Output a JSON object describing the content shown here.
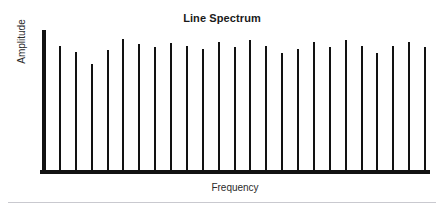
{
  "figure": {
    "background_color": "#ffffff",
    "ink_color": "#121212",
    "divider_color": "#c9c9cf"
  },
  "title": "Line Spectrum",
  "axes": {
    "ylabel": "Amplitude",
    "xlabel": "Frequency"
  },
  "chart_data": {
    "type": "bar",
    "title": "Line Spectrum",
    "subtitle": "",
    "xlabel": "Frequency",
    "ylabel": "Amplitude",
    "grid": false,
    "legend": false,
    "legend_position": "none",
    "xlim": [
      0,
      25
    ],
    "ylim": [
      0,
      1
    ],
    "xticks": [],
    "yticks": [],
    "xticklabels": [],
    "yticklabels": [],
    "categories": [
      "h1",
      "h2",
      "h3",
      "h4",
      "h5",
      "h6",
      "h7",
      "h8",
      "h9",
      "h10",
      "h11",
      "h12",
      "h13",
      "h14",
      "h15",
      "h16",
      "h17",
      "h18",
      "h19",
      "h20",
      "h21",
      "h22",
      "h23",
      "h24",
      "h25"
    ],
    "x": [
      1,
      2,
      3,
      4,
      5,
      6,
      7,
      8,
      9,
      10,
      11,
      12,
      13,
      14,
      15,
      16,
      17,
      18,
      19,
      20,
      21,
      22,
      23,
      24,
      25
    ],
    "values": [
      1.0,
      0.875,
      0.835,
      0.745,
      0.845,
      0.925,
      0.885,
      0.865,
      0.895,
      0.875,
      0.855,
      0.905,
      0.865,
      0.915,
      0.875,
      0.825,
      0.855,
      0.905,
      0.865,
      0.915,
      0.875,
      0.825,
      0.875,
      0.905,
      0.865
    ],
    "bar_width_px": 2,
    "series": [
      {
        "name": "Harmonic amplitude",
        "color": "#121212",
        "values": [
          1.0,
          0.875,
          0.835,
          0.745,
          0.845,
          0.925,
          0.885,
          0.865,
          0.895,
          0.875,
          0.855,
          0.905,
          0.865,
          0.915,
          0.875,
          0.825,
          0.855,
          0.905,
          0.865,
          0.915,
          0.875,
          0.825,
          0.875,
          0.905,
          0.865
        ]
      }
    ]
  }
}
